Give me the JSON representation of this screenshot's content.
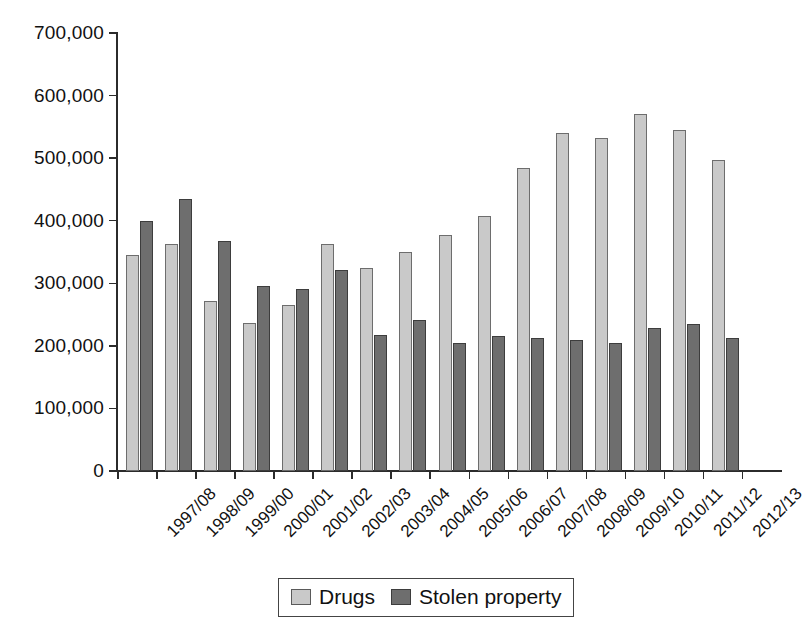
{
  "chart_data": {
    "type": "bar",
    "title": "",
    "subtitle": "",
    "xlabel": "",
    "ylabel": "",
    "ylim": [
      0,
      700000
    ],
    "ytick_labels": [
      "0",
      "100,000",
      "200,000",
      "300,000",
      "400,000",
      "500,000",
      "600,000",
      "700,000"
    ],
    "ytick_values": [
      0,
      100000,
      200000,
      300000,
      400000,
      500000,
      600000,
      700000
    ],
    "grid": false,
    "legend_position": "bottom-center",
    "categories": [
      "1997/08",
      "1998/09",
      "1999/00",
      "2000/01",
      "2001/02",
      "2002/03",
      "2003/04",
      "2004/05",
      "2005/06",
      "2006/07",
      "2007/08",
      "2008/09",
      "2009/10",
      "2010/11",
      "2011/12",
      "2012/13"
    ],
    "series": [
      {
        "name": "Drugs",
        "color": "#c9c9c9",
        "values": [
          345000,
          363000,
          272000,
          236000,
          266000,
          363000,
          324000,
          350000,
          377000,
          407000,
          485000,
          540000,
          532000,
          570000,
          545000,
          497000
        ]
      },
      {
        "name": "Stolen property",
        "color": "#6e6e6e",
        "values": [
          399000,
          434000,
          367000,
          295000,
          291000,
          321000,
          217000,
          242000,
          205000,
          215000,
          213000,
          210000,
          204000,
          228000,
          235000,
          212000
        ]
      }
    ]
  },
  "legend": {
    "entries": [
      {
        "label": "Drugs",
        "swatch": "drugs"
      },
      {
        "label": "Stolen property",
        "swatch": "stolen"
      }
    ]
  }
}
